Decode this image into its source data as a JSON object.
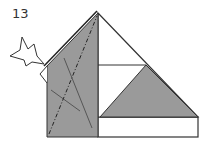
{
  "diagram": {
    "step_number": "13",
    "colors": {
      "paper_colored": "#9a9a9a",
      "paper_white": "#ffffff",
      "line": "#333333"
    },
    "arrow": "push-fold-arrow",
    "lines": [
      "valley-fold-dash-dot",
      "crease-lines"
    ]
  }
}
